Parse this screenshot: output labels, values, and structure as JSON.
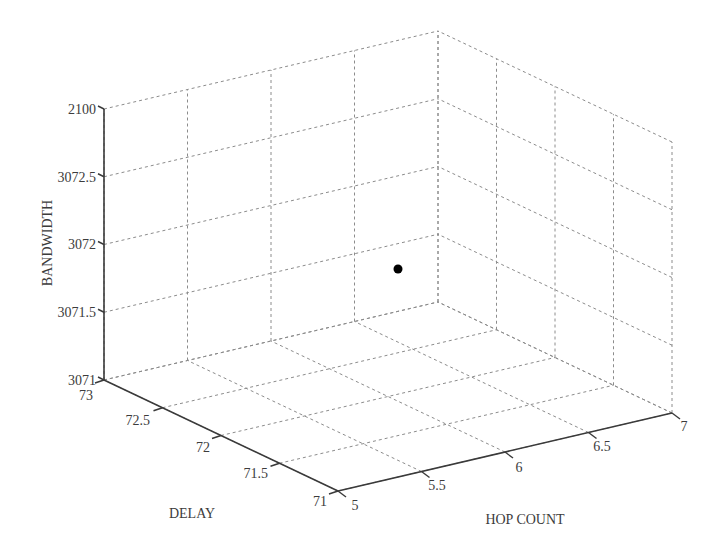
{
  "chart_data": {
    "type": "scatter",
    "projection": "3d",
    "title": "",
    "xlabel": "HOP COUNT",
    "ylabel": "DELAY",
    "zlabel": "BANDWIDTH",
    "xlim": [
      5,
      7
    ],
    "ylim": [
      71,
      73
    ],
    "zlim": [
      3071,
      3073
    ],
    "x_ticks": [
      "5",
      "5.5",
      "6",
      "6.5",
      "7"
    ],
    "y_ticks": [
      "71",
      "71.5",
      "72",
      "72.5",
      "73"
    ],
    "z_ticks": [
      "3071",
      "3071.5",
      "3072",
      "3072.5",
      "2100"
    ],
    "grid": true,
    "legend": null,
    "points": [
      {
        "hop_count": 6,
        "delay": 72,
        "bandwidth": 3072,
        "color": "#000000"
      }
    ]
  },
  "labels": {
    "z_title": "BANDWIDTH",
    "y_title": "DELAY",
    "x_title": "HOP COUNT",
    "z_ticks": [
      "3071",
      "3071.5",
      "3072",
      "3072.5",
      "2100"
    ],
    "y_ticks": [
      "71",
      "71.5",
      "72",
      "72.5",
      "73"
    ],
    "x_ticks": [
      "5",
      "5.5",
      "6",
      "6.5",
      "7"
    ]
  }
}
